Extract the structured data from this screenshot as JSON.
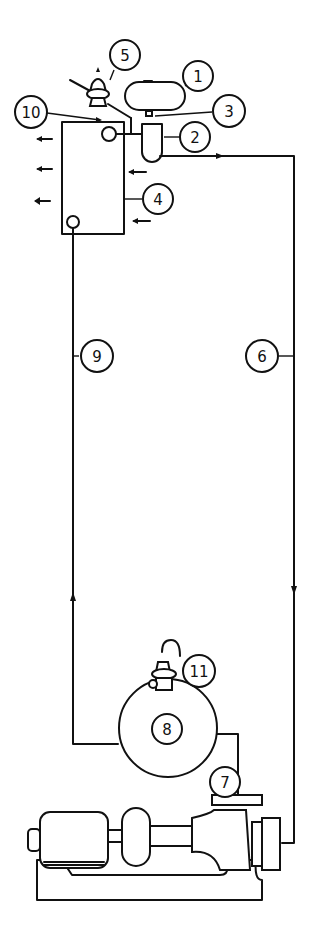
{
  "diagram": {
    "type": "piping-schematic",
    "background": "#ffffff",
    "ink_color": "#111111",
    "callouts": [
      {
        "id": "1",
        "label": "1",
        "target": "expansion-tank"
      },
      {
        "id": "2",
        "label": "2",
        "target": "air-separator"
      },
      {
        "id": "3",
        "label": "3",
        "target": "tank-fitting"
      },
      {
        "id": "4",
        "label": "4",
        "target": "heater-tank"
      },
      {
        "id": "5",
        "label": "5",
        "target": "relief-valve-top"
      },
      {
        "id": "6",
        "label": "6",
        "target": "supply-pipe"
      },
      {
        "id": "7",
        "label": "7",
        "target": "pump-discharge"
      },
      {
        "id": "8",
        "label": "8",
        "target": "boiler"
      },
      {
        "id": "9",
        "label": "9",
        "target": "return-pipe"
      },
      {
        "id": "10",
        "label": "10",
        "target": "heater-inlet"
      },
      {
        "id": "11",
        "label": "11",
        "target": "relief-valve-boiler"
      }
    ],
    "flow_arrows": [
      {
        "location": "left-of-heater",
        "direction": "left",
        "count": 3
      },
      {
        "location": "right-of-heater",
        "direction": "left",
        "count": 2
      },
      {
        "location": "supply-line-top",
        "direction": "right"
      },
      {
        "location": "supply-line-bottom",
        "direction": "down"
      },
      {
        "location": "return-line",
        "direction": "up"
      }
    ]
  }
}
